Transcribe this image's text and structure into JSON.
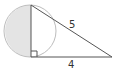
{
  "diagram": {
    "type": "geometry",
    "circle": {
      "cx": 30,
      "cy": 31,
      "r": 26,
      "stroke": "#bdbdbd",
      "shaded_half": "left",
      "shade_color": "#e4e4e4"
    },
    "triangle": {
      "vertices": {
        "top": [
          31,
          5
        ],
        "right_angle": [
          31,
          57
        ],
        "far": [
          112,
          57
        ]
      },
      "right_angle_marker": true,
      "stroke": "#555555"
    },
    "labels": {
      "hypotenuse": "5",
      "base": "4"
    }
  }
}
